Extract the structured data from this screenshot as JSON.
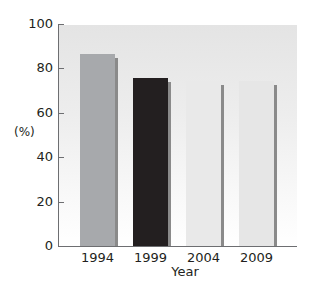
{
  "chart_data": {
    "type": "bar",
    "title": "",
    "xlabel": "Year",
    "ylabel": "(%)",
    "categories": [
      "1994",
      "1999",
      "2004",
      "2009"
    ],
    "values": [
      87,
      76,
      75,
      75
    ],
    "bar_colors": [
      "#a7a9ac",
      "#231f20",
      "#e9e9e9",
      "#e6e6e6"
    ],
    "yticks": [
      0,
      20,
      40,
      60,
      80,
      100
    ],
    "ylim": [
      0,
      100
    ],
    "grid": false,
    "legend": null
  },
  "labels": {
    "ylabel": "(%)",
    "xlabel": "Year",
    "yticks": [
      "0",
      "20",
      "40",
      "60",
      "80",
      "100"
    ],
    "xticks": [
      "1994",
      "1999",
      "2004",
      "2009"
    ]
  }
}
